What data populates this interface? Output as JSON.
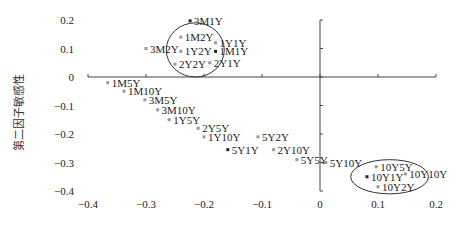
{
  "chart_data": {
    "type": "scatter",
    "title": "",
    "xlabel": "",
    "ylabel": "第二因子敏感性",
    "xlim": [
      -0.4,
      0.2
    ],
    "ylim": [
      -0.4,
      0.2
    ],
    "x_ticks": [
      "-0.4",
      "-0.3",
      "-0.2",
      "-0.1",
      "0",
      "0.1",
      "0.2"
    ],
    "y_ticks": [
      "0.2",
      "0.1",
      "0",
      "-0.1",
      "-0.2",
      "-0.3",
      "-0.4"
    ],
    "grid": false,
    "legend": null,
    "points": [
      {
        "label": "3M1Y",
        "x": -0.224,
        "y": 0.197
      },
      {
        "label": "1M2Y",
        "x": -0.24,
        "y": 0.14
      },
      {
        "label": "1Y1Y",
        "x": -0.18,
        "y": 0.12
      },
      {
        "label": "3M2Y",
        "x": -0.3,
        "y": 0.1
      },
      {
        "label": "1Y2Y",
        "x": -0.24,
        "y": 0.09
      },
      {
        "label": "1M1Y",
        "x": -0.18,
        "y": 0.09
      },
      {
        "label": "2Y2Y",
        "x": -0.25,
        "y": 0.045
      },
      {
        "label": "2Y1Y",
        "x": -0.19,
        "y": 0.05
      },
      {
        "label": "1M5Y",
        "x": -0.366,
        "y": -0.02
      },
      {
        "label": "1M10Y",
        "x": -0.338,
        "y": -0.05
      },
      {
        "label": "3M5Y",
        "x": -0.302,
        "y": -0.08
      },
      {
        "label": "3M10Y",
        "x": -0.28,
        "y": -0.115
      },
      {
        "label": "1Y5Y",
        "x": -0.26,
        "y": -0.15
      },
      {
        "label": "2Y5Y",
        "x": -0.21,
        "y": -0.18
      },
      {
        "label": "1Y10Y",
        "x": -0.2,
        "y": -0.21
      },
      {
        "label": "5Y2Y",
        "x": -0.107,
        "y": -0.21
      },
      {
        "label": "5Y1Y",
        "x": -0.159,
        "y": -0.255
      },
      {
        "label": "2Y10Y",
        "x": -0.08,
        "y": -0.255
      },
      {
        "label": "5Y5Y",
        "x": -0.04,
        "y": -0.29
      },
      {
        "label": "5Y10Y",
        "x": 0.01,
        "y": -0.3
      },
      {
        "label": "10Y5Y",
        "x": 0.097,
        "y": -0.315
      },
      {
        "label": "10Y1Y",
        "x": 0.081,
        "y": -0.35
      },
      {
        "label": "10Y2Y",
        "x": 0.1,
        "y": -0.385
      },
      {
        "label": "10Y10Y",
        "x": 0.147,
        "y": -0.34
      }
    ],
    "annotations": [
      {
        "type": "ellipse",
        "around": [
          "1M2Y",
          "1Y2Y",
          "1M1Y",
          "2Y2Y",
          "2Y1Y"
        ],
        "center": [
          -0.215,
          0.095
        ],
        "rx": 0.05,
        "ry": 0.095
      },
      {
        "type": "ellipse",
        "around": [
          "10Y5Y",
          "10Y1Y",
          "10Y2Y"
        ],
        "center": [
          0.12,
          -0.35
        ],
        "rx": 0.067,
        "ry": 0.06
      }
    ]
  }
}
